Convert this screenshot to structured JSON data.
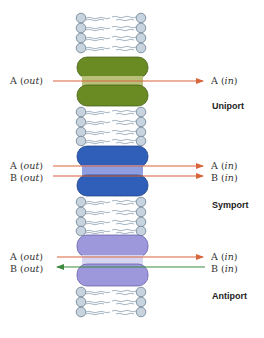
{
  "colors": {
    "lipid_head_fill": "#c7d3de",
    "lipid_head_stroke": "#6d7f90",
    "lipid_tail": "#8fa2b3",
    "uniport_lobe": "#6a8a24",
    "uniport_channel": "#b8c07a",
    "symport_lobe": "#2f5fb8",
    "symport_channel": "#8f9ee0",
    "antiport_lobe": "#9d97dc",
    "antiport_channel": "#d6d6f2",
    "arrow_orange": "#d8643a",
    "arrow_green": "#3d8a3d"
  },
  "transporters": [
    {
      "name": "Uniport",
      "arrows": [
        {
          "left": "A",
          "left_suffix": "out",
          "right": "A",
          "right_suffix": "in",
          "direction": "in",
          "color": "orange"
        }
      ]
    },
    {
      "name": "Symport",
      "arrows": [
        {
          "left": "A",
          "left_suffix": "out",
          "right": "A",
          "right_suffix": "in",
          "direction": "in",
          "color": "orange"
        },
        {
          "left": "B",
          "left_suffix": "out",
          "right": "B",
          "right_suffix": "in",
          "direction": "in",
          "color": "orange"
        }
      ]
    },
    {
      "name": "Antiport",
      "arrows": [
        {
          "left": "A",
          "left_suffix": "out",
          "right": "A",
          "right_suffix": "in",
          "direction": "in",
          "color": "orange"
        },
        {
          "left": "B",
          "left_suffix": "out",
          "right": "B",
          "right_suffix": "in",
          "direction": "out",
          "color": "green"
        }
      ]
    }
  ],
  "labels": {
    "uniport_a_out_letter": "A (",
    "uniport_a_out_italic": "out",
    "uniport_a_in_letter": "A (",
    "uniport_a_in_italic": "in",
    "uniport_title": "Uniport",
    "symport_a_out_letter": "A (",
    "symport_a_out_italic": "out",
    "symport_b_out_letter": "B (",
    "symport_b_out_italic": "out",
    "symport_a_in_letter": "A (",
    "symport_a_in_italic": "in",
    "symport_b_in_letter": "B (",
    "symport_b_in_italic": "in",
    "symport_title": "Symport",
    "antiport_a_out_letter": "A (",
    "antiport_a_out_italic": "out",
    "antiport_b_out_letter": "B (",
    "antiport_b_out_italic": "out",
    "antiport_a_in_letter": "A (",
    "antiport_a_in_italic": "in",
    "antiport_b_in_letter": "B (",
    "antiport_b_in_italic": "in",
    "antiport_title": "Antiport",
    "close_paren": ")"
  }
}
